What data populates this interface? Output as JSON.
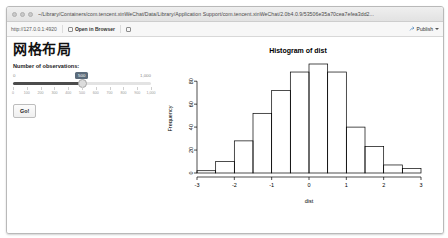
{
  "window": {
    "title": "~/Library/Containers/com.tencent.xinWeChat/Data/Library/Application Support/com.tencent.xinWeChat/2.0b4.0.9/53506e35a70cea7efea3dd2...",
    "traffic_lights": [
      "close",
      "minimize",
      "zoom"
    ]
  },
  "toolbar": {
    "url": "http://127.0.0.1:4920",
    "open_in_browser_label": "Open in Browser",
    "publish_label": "Publish",
    "publish_caret": "▾"
  },
  "app": {
    "title": "网格布局",
    "control_label": "Number of observations:",
    "slider": {
      "min_label": "0",
      "max_label": "1,000",
      "value_label": "500",
      "value": 500,
      "min": 0,
      "max": 1000,
      "tick_labels": [
        "0",
        "100",
        "200",
        "300",
        "400",
        "500",
        "600",
        "700",
        "800",
        "900",
        "1,000"
      ]
    },
    "go_label": "Go!"
  },
  "chart_data": {
    "type": "bar",
    "title": "Histogram of dist",
    "xlabel": "dist",
    "ylabel": "Frequency",
    "grid": false,
    "legend": null,
    "xlim": [
      -3,
      3
    ],
    "ylim": [
      0,
      95
    ],
    "xticks": [
      -3,
      -2,
      -1,
      0,
      1,
      2,
      3
    ],
    "yticks": [
      0,
      20,
      40,
      60,
      80
    ],
    "bin_width": 0.5,
    "bin_edges": [
      -3,
      -2.5,
      -2,
      -1.5,
      -1,
      -0.5,
      0,
      0.5,
      1,
      1.5,
      2,
      2.5,
      3
    ],
    "categories": [
      "-3 to -2.5",
      "-2.5 to -2",
      "-2 to -1.5",
      "-1.5 to -1",
      "-1 to -0.5",
      "-0.5 to 0",
      "0 to 0.5",
      "0.5 to 1",
      "1 to 1.5",
      "1.5 to 2",
      "2 to 2.5",
      "2.5 to 3"
    ],
    "values": [
      2,
      10,
      28,
      52,
      72,
      88,
      95,
      88,
      40,
      23,
      7,
      4
    ]
  }
}
